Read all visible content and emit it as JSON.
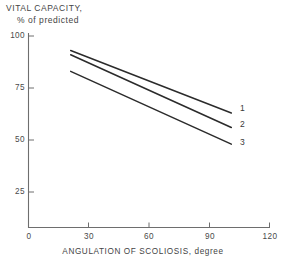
{
  "chart_data": {
    "type": "line",
    "title": "",
    "ylabel_line1": "VITAL CAPACITY,",
    "ylabel_line2": "% of predicted",
    "xlabel": "ANGULATION OF SCOLIOSIS, degree",
    "xlim": [
      0,
      120
    ],
    "ylim": [
      0,
      100
    ],
    "xticks": [
      0,
      30,
      60,
      90,
      120
    ],
    "xtick_labels": [
      "0",
      "30",
      "60",
      "90",
      "120"
    ],
    "yticks": [
      25,
      50,
      75,
      100
    ],
    "ytick_labels": [
      "25",
      "50",
      "75",
      "100"
    ],
    "grid": false,
    "legend_position": "right-end-of-line",
    "series": [
      {
        "name": "1",
        "label": "1",
        "x": [
          21,
          101
        ],
        "y": [
          93,
          63
        ],
        "color": "#2b2b2b"
      },
      {
        "name": "2",
        "label": "2",
        "x": [
          21,
          101
        ],
        "y": [
          91,
          56
        ],
        "color": "#2b2b2b"
      },
      {
        "name": "3",
        "label": "3",
        "x": [
          21,
          101
        ],
        "y": [
          83,
          48
        ],
        "color": "#2b2b2b"
      }
    ],
    "annotations": []
  },
  "axis_color": "#6e6e6e",
  "line_color": "#2b2b2b"
}
